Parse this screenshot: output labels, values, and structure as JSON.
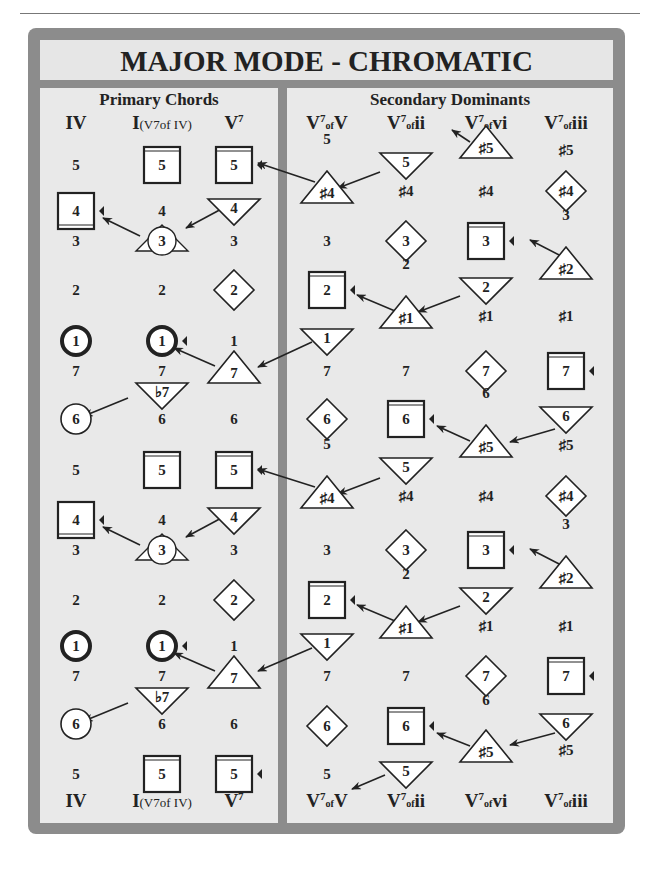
{
  "title": "MAJOR MODE - CHROMATIC",
  "sections": {
    "primary": "Primary Chords",
    "secondary": "Secondary Dominants"
  },
  "column_headers": [
    {
      "main": "IV",
      "sup": "",
      "sub": "",
      "extra": "",
      "x": 76
    },
    {
      "main": "I",
      "sup": "",
      "sub": "",
      "extra": "(V7of IV)",
      "x": 162
    },
    {
      "main": "V",
      "sup": "7",
      "sub": "",
      "extra": "",
      "x": 234
    },
    {
      "main": "V",
      "sup": "7",
      "sub": "of",
      "extra": "V",
      "x": 327
    },
    {
      "main": "V",
      "sup": "7",
      "sub": "of",
      "extra": "ii",
      "x": 406
    },
    {
      "main": "V",
      "sup": "7",
      "sub": "of",
      "extra": "vi",
      "x": 486
    },
    {
      "main": "V",
      "sup": "7",
      "sub": "of",
      "extra": "iii",
      "x": 566
    }
  ],
  "colors": {
    "frame": "#8c8c8c",
    "panel": "#e9e9e9",
    "shape_fill": "#ffffff",
    "stroke": "#222222"
  },
  "elements": [
    {
      "c": 0,
      "y": 165,
      "label": "5",
      "shape": "text"
    },
    {
      "c": 1,
      "y": 165,
      "label": "5",
      "shape": "square-top"
    },
    {
      "c": 2,
      "y": 165,
      "label": "5",
      "shape": "square-top",
      "marker": true
    },
    {
      "c": 3,
      "y": 165,
      "label": "5",
      "shape": "text",
      "dy": -26
    },
    {
      "c": 3,
      "y": 191,
      "label": "♯4",
      "shape": "tri-up"
    },
    {
      "c": 4,
      "y": 165,
      "label": "5",
      "shape": "tri-down"
    },
    {
      "c": 4,
      "y": 191,
      "label": "♯4",
      "shape": "text"
    },
    {
      "c": 5,
      "y": 146,
      "label": "♯5",
      "shape": "tri-up"
    },
    {
      "c": 5,
      "y": 191,
      "label": "♯4",
      "shape": "text"
    },
    {
      "c": 6,
      "y": 150,
      "label": "♯5",
      "shape": "text"
    },
    {
      "c": 6,
      "y": 191,
      "label": "♯4",
      "shape": "diamond"
    },
    {
      "c": 0,
      "y": 211,
      "label": "4",
      "shape": "square-bottom",
      "marker": true
    },
    {
      "c": 1,
      "y": 211,
      "label": "4",
      "shape": "text"
    },
    {
      "c": 2,
      "y": 211,
      "label": "4",
      "shape": "tri-down"
    },
    {
      "c": 0,
      "y": 241,
      "label": "3",
      "shape": "text"
    },
    {
      "c": 1,
      "y": 241,
      "label": "3",
      "shape": "circle-tri"
    },
    {
      "c": 2,
      "y": 241,
      "label": "3",
      "shape": "text"
    },
    {
      "c": 3,
      "y": 241,
      "label": "3",
      "shape": "text"
    },
    {
      "c": 4,
      "y": 241,
      "label": "3",
      "shape": "diamond"
    },
    {
      "c": 5,
      "y": 241,
      "label": "3",
      "shape": "square-top",
      "marker": true
    },
    {
      "c": 6,
      "y": 241,
      "label": "3",
      "shape": "text",
      "dy": -26
    },
    {
      "c": 6,
      "y": 267,
      "label": "♯2",
      "shape": "tri-up"
    },
    {
      "c": 0,
      "y": 290,
      "label": "2",
      "shape": "text"
    },
    {
      "c": 1,
      "y": 290,
      "label": "2",
      "shape": "text"
    },
    {
      "c": 2,
      "y": 290,
      "label": "2",
      "shape": "diamond"
    },
    {
      "c": 3,
      "y": 290,
      "label": "2",
      "shape": "square-top",
      "marker": true
    },
    {
      "c": 4,
      "y": 290,
      "label": "2",
      "shape": "text",
      "dy": -26
    },
    {
      "c": 4,
      "y": 316,
      "label": "♯1",
      "shape": "tri-up"
    },
    {
      "c": 5,
      "y": 290,
      "label": "2",
      "shape": "tri-down"
    },
    {
      "c": 5,
      "y": 316,
      "label": "♯1",
      "shape": "text"
    },
    {
      "c": 6,
      "y": 316,
      "label": "♯1",
      "shape": "text"
    },
    {
      "c": 0,
      "y": 341,
      "label": "1",
      "shape": "circle-bold"
    },
    {
      "c": 1,
      "y": 341,
      "label": "1",
      "shape": "circle-bold",
      "marker": true
    },
    {
      "c": 2,
      "y": 341,
      "label": "1",
      "shape": "text"
    },
    {
      "c": 3,
      "y": 341,
      "label": "1",
      "shape": "tri-down"
    },
    {
      "c": 0,
      "y": 371,
      "label": "7",
      "shape": "text"
    },
    {
      "c": 1,
      "y": 371,
      "label": "7",
      "shape": "text"
    },
    {
      "c": 2,
      "y": 371,
      "label": "7",
      "shape": "tri-up"
    },
    {
      "c": 3,
      "y": 371,
      "label": "7",
      "shape": "text"
    },
    {
      "c": 4,
      "y": 371,
      "label": "7",
      "shape": "text"
    },
    {
      "c": 5,
      "y": 371,
      "label": "7",
      "shape": "diamond"
    },
    {
      "c": 6,
      "y": 371,
      "label": "7",
      "shape": "square-top",
      "marker": true
    },
    {
      "c": 1,
      "y": 395,
      "label": "♭7",
      "shape": "tri-down"
    },
    {
      "c": 0,
      "y": 419,
      "label": "6",
      "shape": "circle"
    },
    {
      "c": 1,
      "y": 419,
      "label": "6",
      "shape": "text"
    },
    {
      "c": 2,
      "y": 419,
      "label": "6",
      "shape": "text"
    },
    {
      "c": 3,
      "y": 419,
      "label": "6",
      "shape": "diamond"
    },
    {
      "c": 4,
      "y": 419,
      "label": "6",
      "shape": "square-top",
      "marker": true
    },
    {
      "c": 5,
      "y": 419,
      "label": "6",
      "shape": "text",
      "dy": -26
    },
    {
      "c": 5,
      "y": 445,
      "label": "♯5",
      "shape": "tri-up"
    },
    {
      "c": 6,
      "y": 419,
      "label": "6",
      "shape": "tri-down"
    },
    {
      "c": 6,
      "y": 445,
      "label": "♯5",
      "shape": "text"
    },
    {
      "c": 0,
      "y": 470,
      "label": "5",
      "shape": "text"
    },
    {
      "c": 1,
      "y": 470,
      "label": "5",
      "shape": "square-top"
    },
    {
      "c": 2,
      "y": 470,
      "label": "5",
      "shape": "square-top",
      "marker": true
    },
    {
      "c": 3,
      "y": 470,
      "label": "5",
      "shape": "text",
      "dy": -26
    },
    {
      "c": 3,
      "y": 496,
      "label": "♯4",
      "shape": "tri-up"
    },
    {
      "c": 4,
      "y": 470,
      "label": "5",
      "shape": "tri-down"
    },
    {
      "c": 4,
      "y": 496,
      "label": "♯4",
      "shape": "text"
    },
    {
      "c": 5,
      "y": 496,
      "label": "♯4",
      "shape": "text"
    },
    {
      "c": 6,
      "y": 496,
      "label": "♯4",
      "shape": "diamond"
    },
    {
      "c": 0,
      "y": 520,
      "label": "4",
      "shape": "square-bottom",
      "marker": true
    },
    {
      "c": 1,
      "y": 520,
      "label": "4",
      "shape": "text"
    },
    {
      "c": 2,
      "y": 520,
      "label": "4",
      "shape": "tri-down"
    },
    {
      "c": 0,
      "y": 550,
      "label": "3",
      "shape": "text"
    },
    {
      "c": 1,
      "y": 550,
      "label": "3",
      "shape": "circle-tri"
    },
    {
      "c": 2,
      "y": 550,
      "label": "3",
      "shape": "text"
    },
    {
      "c": 3,
      "y": 550,
      "label": "3",
      "shape": "text"
    },
    {
      "c": 4,
      "y": 550,
      "label": "3",
      "shape": "diamond"
    },
    {
      "c": 5,
      "y": 550,
      "label": "3",
      "shape": "square-top",
      "marker": true
    },
    {
      "c": 6,
      "y": 550,
      "label": "3",
      "shape": "text",
      "dy": -26
    },
    {
      "c": 6,
      "y": 576,
      "label": "♯2",
      "shape": "tri-up"
    },
    {
      "c": 0,
      "y": 600,
      "label": "2",
      "shape": "text"
    },
    {
      "c": 1,
      "y": 600,
      "label": "2",
      "shape": "text"
    },
    {
      "c": 2,
      "y": 600,
      "label": "2",
      "shape": "diamond"
    },
    {
      "c": 3,
      "y": 600,
      "label": "2",
      "shape": "square-top",
      "marker": true
    },
    {
      "c": 4,
      "y": 600,
      "label": "2",
      "shape": "text",
      "dy": -26
    },
    {
      "c": 4,
      "y": 626,
      "label": "♯1",
      "shape": "tri-up"
    },
    {
      "c": 5,
      "y": 600,
      "label": "2",
      "shape": "tri-down"
    },
    {
      "c": 5,
      "y": 626,
      "label": "♯1",
      "shape": "text"
    },
    {
      "c": 6,
      "y": 626,
      "label": "♯1",
      "shape": "text"
    },
    {
      "c": 0,
      "y": 646,
      "label": "1",
      "shape": "circle-bold"
    },
    {
      "c": 1,
      "y": 646,
      "label": "1",
      "shape": "circle-bold",
      "marker": true
    },
    {
      "c": 2,
      "y": 646,
      "label": "1",
      "shape": "text"
    },
    {
      "c": 3,
      "y": 646,
      "label": "1",
      "shape": "tri-down"
    },
    {
      "c": 0,
      "y": 676,
      "label": "7",
      "shape": "text"
    },
    {
      "c": 1,
      "y": 676,
      "label": "7",
      "shape": "text"
    },
    {
      "c": 2,
      "y": 676,
      "label": "7",
      "shape": "tri-up"
    },
    {
      "c": 3,
      "y": 676,
      "label": "7",
      "shape": "text"
    },
    {
      "c": 4,
      "y": 676,
      "label": "7",
      "shape": "text"
    },
    {
      "c": 5,
      "y": 676,
      "label": "7",
      "shape": "diamond"
    },
    {
      "c": 6,
      "y": 676,
      "label": "7",
      "shape": "square-top",
      "marker": true
    },
    {
      "c": 1,
      "y": 700,
      "label": "♭7",
      "shape": "tri-down"
    },
    {
      "c": 0,
      "y": 724,
      "label": "6",
      "shape": "circle"
    },
    {
      "c": 1,
      "y": 724,
      "label": "6",
      "shape": "text"
    },
    {
      "c": 2,
      "y": 724,
      "label": "6",
      "shape": "text"
    },
    {
      "c": 3,
      "y": 726,
      "label": "6",
      "shape": "diamond"
    },
    {
      "c": 4,
      "y": 726,
      "label": "6",
      "shape": "square-top",
      "marker": true
    },
    {
      "c": 5,
      "y": 726,
      "label": "6",
      "shape": "text",
      "dy": -26
    },
    {
      "c": 5,
      "y": 750,
      "label": "♯5",
      "shape": "tri-up"
    },
    {
      "c": 6,
      "y": 726,
      "label": "6",
      "shape": "tri-down"
    },
    {
      "c": 6,
      "y": 750,
      "label": "♯5",
      "shape": "text"
    },
    {
      "c": 0,
      "y": 774,
      "label": "5",
      "shape": "text"
    },
    {
      "c": 1,
      "y": 774,
      "label": "5",
      "shape": "square-top"
    },
    {
      "c": 2,
      "y": 774,
      "label": "5",
      "shape": "square-top",
      "marker": true
    },
    {
      "c": 3,
      "y": 774,
      "label": "5",
      "shape": "text"
    },
    {
      "c": 4,
      "y": 774,
      "label": "5",
      "shape": "tri-down"
    }
  ],
  "arrows": [
    [
      315,
      182,
      258,
      163
    ],
    [
      380,
      172,
      338,
      188
    ],
    [
      470,
      142,
      452,
      130
    ],
    [
      227,
      206,
      186,
      228
    ],
    [
      140,
      236,
      103,
      218
    ],
    [
      565,
      258,
      530,
      240
    ],
    [
      460,
      296,
      418,
      312
    ],
    [
      395,
      311,
      357,
      295
    ],
    [
      312,
      342,
      258,
      367
    ],
    [
      215,
      366,
      174,
      348
    ],
    [
      128,
      398,
      84,
      416
    ],
    [
      555,
      429,
      510,
      442
    ],
    [
      470,
      441,
      437,
      426
    ],
    [
      315,
      487,
      258,
      469
    ],
    [
      380,
      478,
      338,
      494
    ],
    [
      227,
      515,
      186,
      537
    ],
    [
      140,
      545,
      103,
      527
    ],
    [
      565,
      567,
      530,
      549
    ],
    [
      460,
      606,
      418,
      622
    ],
    [
      395,
      621,
      357,
      605
    ],
    [
      312,
      648,
      258,
      671
    ],
    [
      215,
      671,
      174,
      653
    ],
    [
      128,
      703,
      84,
      721
    ],
    [
      555,
      733,
      510,
      745
    ],
    [
      470,
      746,
      437,
      733
    ],
    [
      385,
      775,
      352,
      789
    ]
  ]
}
